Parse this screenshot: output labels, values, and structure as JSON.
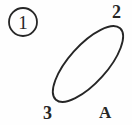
{
  "figure": {
    "background_color": "#fefefe",
    "stroke_color": "#262626",
    "index_badge": {
      "shape": "circle",
      "label": "1",
      "center_x": 23,
      "center_y": 22,
      "radius": 14,
      "stroke_width": 1.8
    },
    "ellipse": {
      "center_x": 88,
      "center_y": 64,
      "semi_major": 48,
      "semi_minor": 19,
      "rotation_deg": -48,
      "stroke_width": 1.9,
      "fill": "none"
    },
    "labels": [
      {
        "text": "2",
        "x": 112,
        "y": 3,
        "position": "top-right"
      },
      {
        "text": "3",
        "x": 43,
        "y": 104,
        "position": "bottom-left"
      },
      {
        "text": "A",
        "x": 99,
        "y": 104,
        "position": "bottom-right"
      }
    ]
  },
  "chart_data": {
    "type": "diagram",
    "title": "",
    "elements": [
      {
        "name": "figure-index",
        "kind": "circled-number",
        "value": "1"
      },
      {
        "name": "ellipse",
        "kind": "ellipse",
        "rotation_deg": -48
      },
      {
        "name": "label-2",
        "kind": "text",
        "value": "2"
      },
      {
        "name": "label-3",
        "kind": "text",
        "value": "3"
      },
      {
        "name": "label-A",
        "kind": "text",
        "value": "A"
      }
    ]
  }
}
